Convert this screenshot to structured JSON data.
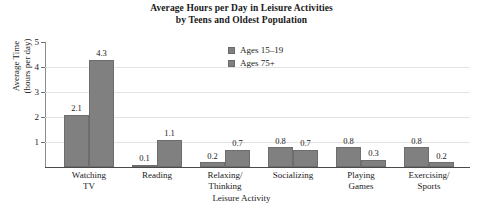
{
  "chart_data": {
    "type": "bar",
    "title": "Average Hours per Day in Leisure Activities\nby Teens and Oldest Population",
    "title_line1": "Average Hours per Day in Leisure Activities",
    "title_line2": "by Teens and Oldest Population",
    "xlabel": "Leisure Activity",
    "ylabel": "Average Time\n(hours per day)",
    "ylabel_line1": "Average Time",
    "ylabel_line2": "(hours per day)",
    "ylim": [
      0,
      5
    ],
    "ytick_labels": [
      "5",
      "4",
      "3",
      "2",
      "1"
    ],
    "ytick_values": [
      5,
      4,
      3,
      2,
      1
    ],
    "grid": true,
    "legend_position": "top-center",
    "categories": [
      "Watching TV",
      "Reading",
      "Relaxing/ Thinking",
      "Socializing",
      "Playing Games",
      "Exercising/ Sports"
    ],
    "category_lines": [
      [
        "Watching",
        "TV"
      ],
      [
        "Reading",
        ""
      ],
      [
        "Relaxing/",
        "Thinking"
      ],
      [
        "Socializing",
        ""
      ],
      [
        "Playing",
        "Games"
      ],
      [
        "Exercising/",
        "Sports"
      ]
    ],
    "series": [
      {
        "name": "Ages 15–19",
        "color": "#808080",
        "values": [
          2.1,
          0.1,
          0.2,
          0.8,
          0.8,
          0.8
        ],
        "labels": [
          "2.1",
          "0.1",
          "0.2",
          "0.8",
          "0.8",
          "0.8"
        ]
      },
      {
        "name": "Ages 75+",
        "color": "#808080",
        "values": [
          4.3,
          1.1,
          0.7,
          0.7,
          0.3,
          0.2
        ],
        "labels": [
          "4.3",
          "1.1",
          "0.7",
          "0.7",
          "0.3",
          "0.2"
        ]
      }
    ]
  },
  "legend": {
    "items": [
      {
        "label": "Ages 15–19"
      },
      {
        "label": "Ages 75+"
      }
    ]
  }
}
